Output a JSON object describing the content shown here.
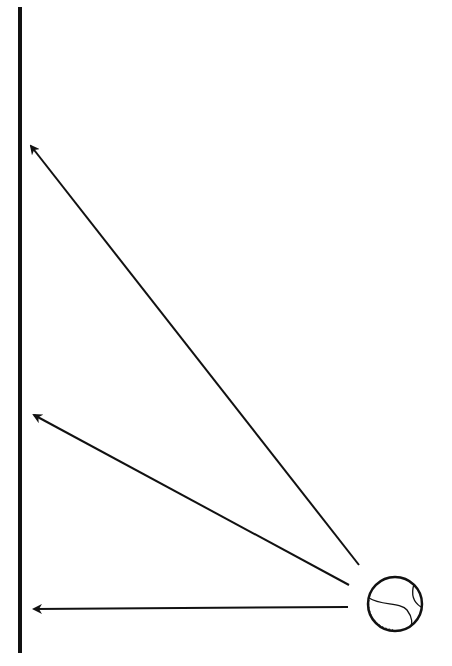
{
  "diagram": {
    "background": "#ffffff",
    "stroke_color": "#111111",
    "wall": {
      "x": 20,
      "y1": 7,
      "y2": 653,
      "width": 4
    },
    "ball": {
      "cx": 395,
      "cy": 604,
      "r": 27
    },
    "arrows": [
      {
        "name": "arrow-steep",
        "x1": 359,
        "y1": 565,
        "x2": 31,
        "y2": 146
      },
      {
        "name": "arrow-medium",
        "x1": 349,
        "y1": 585,
        "x2": 34,
        "y2": 415
      },
      {
        "name": "arrow-horizontal",
        "x1": 348,
        "y1": 607,
        "x2": 34,
        "y2": 609
      }
    ]
  }
}
